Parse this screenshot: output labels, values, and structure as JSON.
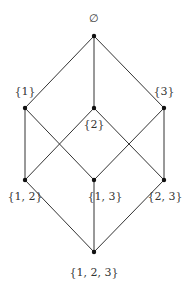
{
  "diagram": {
    "type": "hasse-diagram",
    "colors": {
      "edge": "#333333",
      "node": "#111111",
      "label": "#333333"
    },
    "nodes": [
      {
        "id": "empty",
        "label": "∅",
        "x": 94,
        "y": 36,
        "lx": 94,
        "ly": 22,
        "anchor": "middle"
      },
      {
        "id": "s1",
        "label": "{1}",
        "x": 25,
        "y": 108,
        "lx": 25,
        "ly": 95,
        "anchor": "middle"
      },
      {
        "id": "s2",
        "label": "{2}",
        "x": 94,
        "y": 108,
        "lx": 94,
        "ly": 128,
        "anchor": "middle"
      },
      {
        "id": "s3",
        "label": "{3}",
        "x": 164,
        "y": 108,
        "lx": 164,
        "ly": 95,
        "anchor": "middle"
      },
      {
        "id": "s12",
        "label": "{1, 2}",
        "x": 25,
        "y": 180,
        "lx": 25,
        "ly": 200,
        "anchor": "middle"
      },
      {
        "id": "s13",
        "label": "{1, 3}",
        "x": 94,
        "y": 180,
        "lx": 105,
        "ly": 200,
        "anchor": "middle"
      },
      {
        "id": "s23",
        "label": "{2, 3}",
        "x": 164,
        "y": 180,
        "lx": 165,
        "ly": 200,
        "anchor": "middle"
      },
      {
        "id": "s123",
        "label": "{1, 2, 3}",
        "x": 94,
        "y": 252,
        "lx": 94,
        "ly": 276,
        "anchor": "middle"
      }
    ],
    "edges": [
      [
        "empty",
        "s1"
      ],
      [
        "empty",
        "s2"
      ],
      [
        "empty",
        "s3"
      ],
      [
        "s1",
        "s12"
      ],
      [
        "s1",
        "s13"
      ],
      [
        "s2",
        "s12"
      ],
      [
        "s2",
        "s23"
      ],
      [
        "s3",
        "s13"
      ],
      [
        "s3",
        "s23"
      ],
      [
        "s12",
        "s123"
      ],
      [
        "s13",
        "s123"
      ],
      [
        "s23",
        "s123"
      ]
    ]
  }
}
